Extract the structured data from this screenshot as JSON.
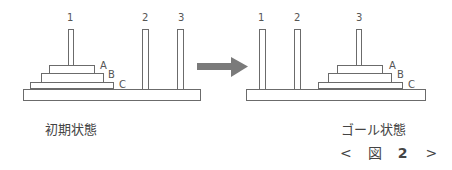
{
  "initial": {
    "caption": "初期状態",
    "pegs": [
      {
        "label": "1"
      },
      {
        "label": "2"
      },
      {
        "label": "3"
      }
    ],
    "disks": [
      {
        "label": "A"
      },
      {
        "label": "B"
      },
      {
        "label": "C"
      }
    ]
  },
  "goal": {
    "caption": "ゴール状態",
    "pegs": [
      {
        "label": "1"
      },
      {
        "label": "2"
      },
      {
        "label": "3"
      }
    ],
    "disks": [
      {
        "label": "A"
      },
      {
        "label": "B"
      },
      {
        "label": "C"
      }
    ]
  },
  "figure": {
    "prev": "<",
    "label": "図",
    "number": "2",
    "next": ">"
  },
  "colors": {
    "outline": "#6b6b6b",
    "arrow": "#7a7a7a",
    "text": "#444444"
  }
}
